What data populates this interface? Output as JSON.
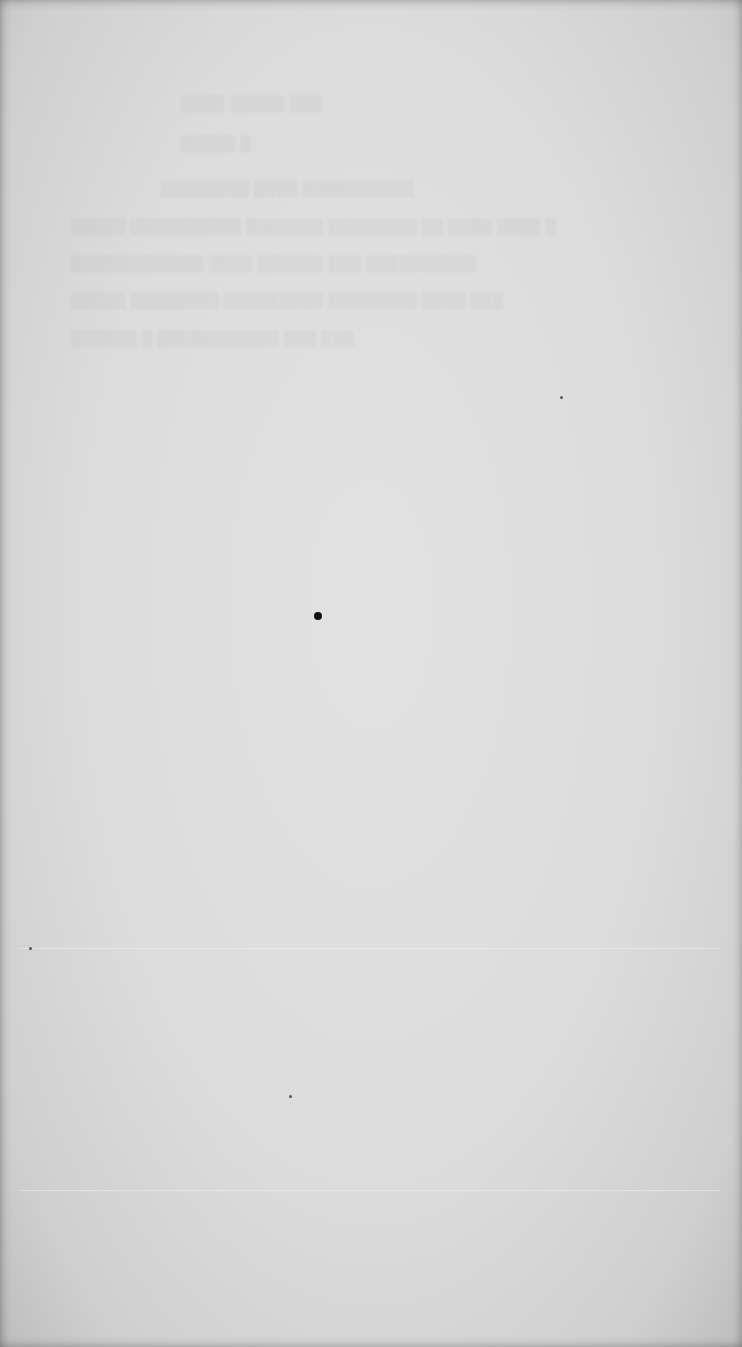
{
  "document": {
    "type": "scanned blank page",
    "description": "Blank paper page with faint illegible show-through text from the reverse side",
    "paper_color": "#dcdcdc",
    "showthrough_lines": [
      "▒▒▒ ▒▒▒▒▒ ▒▒▒▒",
      "▒ ▒▒▒▒▒",
      "▒▒▒▒▒▒▒▒▒▒ ▒▒▒▒ ▒▒▒▒▒▒▒▒",
      "▒ ▒▒▒▒ ▒▒▒▒ ▒▒ ▒▒▒▒▒▒▒▒ ▒▒▒▒▒▒▒ ▒▒▒▒▒▒▒▒▒▒ ▒▒▒▒▒",
      "▒▒▒▒▒▒▒▒▒▒ ▒▒▒ ▒▒▒▒▒▒ ▒▒▒▒ ▒▒▒▒▒▒▒▒▒▒▒▒",
      "▒▒▒ ▒▒▒▒ ▒▒▒▒▒▒▒▒ ▒▒▒▒▒▒▒▒▒ ▒▒▒▒▒▒▒▒ ▒▒▒▒▒",
      "▒▒▒ ▒▒▒ ▒▒▒▒▒▒▒▒▒▒▒ ▒ ▒▒▒▒▒▒"
    ],
    "specks": [
      {
        "x": 318,
        "y": 616,
        "r": 4
      },
      {
        "x": 561,
        "y": 397,
        "r": 1.5
      },
      {
        "x": 30,
        "y": 948,
        "r": 1.5
      },
      {
        "x": 290,
        "y": 1096,
        "r": 1.5
      }
    ]
  }
}
